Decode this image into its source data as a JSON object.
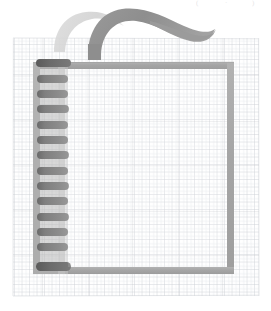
{
  "canvas": {
    "width": 271,
    "height": 311,
    "background_color": "#ffffff",
    "title": "Spiral notebook on grid paper"
  },
  "palette": {
    "paper_white": "#ffffff",
    "grid_line": "#c3c6cc",
    "grid_line_soft": "#d6d9de",
    "frame_gray": "#a9a9a9",
    "frame_gray_dark": "#9b9b9b",
    "ring_dark": "#6e6e6e",
    "ring_mid": "#8a8a8a",
    "ring_edge_dark": "#5f5f5f",
    "ribbon_dark": "#949494",
    "ribbon_light": "#d8d8d8",
    "faint_pencil": "#cfcfcf"
  },
  "grid_paper": {
    "name": "graph-paper-sheet",
    "x": 13,
    "y": 38,
    "width": 246,
    "height": 258,
    "cell_size": 7.5,
    "line_color": "#c6c9cf",
    "line_width": 0.8
  },
  "notebook": {
    "name": "spiral-notebook",
    "frame": {
      "label": "notebook-cover-frame",
      "x": 33,
      "y": 62,
      "width": 201,
      "height": 212,
      "stroke_color": "#a9a9a9",
      "stroke_width": 7
    },
    "binding": {
      "label": "spiral-binding",
      "ring_count": 14,
      "ring_x": 37,
      "ring_width": 31,
      "ring_height": 8,
      "ring_top": 60,
      "ring_spacing": 15.4,
      "ring_color": "#7d7d7d",
      "ring_color_first": "#5f5f5f",
      "ring_color_last": "#5f5f5f",
      "spine_x": 33,
      "spine_width": 32,
      "spine_color": "#b5b5b5"
    },
    "page_area": {
      "label": "notebook-blank-page",
      "x": 68,
      "y": 66,
      "width": 162,
      "height": 204,
      "fill": "#ffffff"
    }
  },
  "ribbons": [
    {
      "name": "ribbon-stroke-back",
      "role": "light background swoosh",
      "color": "#d8d8d8",
      "opacity": 0.95,
      "description": "pale gray curved stroke rising from left of spine and arcing right"
    },
    {
      "name": "ribbon-stroke-front",
      "role": "dark foreground swoosh",
      "color": "#949494",
      "opacity": 1,
      "description": "medium gray tapering brush stroke arcing up and sweeping right off toward the upper right"
    }
  ],
  "faint_marks": [
    {
      "name": "faint-mark-left",
      "text": "(",
      "x": 196,
      "y": 1
    },
    {
      "name": "faint-mark-center",
      "text": "·",
      "x": 225,
      "y": 1
    },
    {
      "name": "faint-mark-right",
      "text": ")",
      "x": 252,
      "y": 1
    }
  ]
}
